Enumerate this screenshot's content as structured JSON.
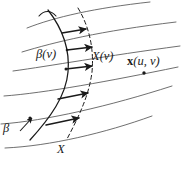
{
  "figure": {
    "kind": "geometry-diagram",
    "width": 184,
    "height": 169,
    "background_color": "#ffffff",
    "ink_color": "#1a1a1a",
    "grid_color": "#555555"
  },
  "labels": {
    "beta_of_v": "β(v)",
    "X_of_v": "X(v)",
    "x_of_u_v_vector": "x",
    "x_of_u_v_args": "(u, v)",
    "beta": "β",
    "X": "X"
  },
  "curves": {
    "surface_parameter_lines": [
      {
        "name": "u-curve-1",
        "path": "M 27 28 C 55 17, 95 8, 150 2"
      },
      {
        "name": "u-curve-2",
        "path": "M 22 52 C 55 42, 100 31, 176 22"
      },
      {
        "name": "u-curve-3",
        "path": "M 13 71 C 50 66, 105 56, 180 46"
      },
      {
        "name": "u-curve-4",
        "path": "M 4 96 C 45 93, 110 81, 178 67"
      },
      {
        "name": "u-curve-5",
        "path": "M 1 124 C 45 121, 110 106, 172 86"
      },
      {
        "name": "u-curve-6",
        "path": "M 5 148 C 50 146, 105 133, 152 116"
      }
    ],
    "beta_curve": {
      "name": "beta-curve-solid",
      "path": "M 48 10 C 62 28, 70 50, 68 72 C 66 96, 50 118, 30 140",
      "style": "solid"
    },
    "X_curve": {
      "name": "X-curve-dashed",
      "path": "M 78 8 C 90 28, 94 50, 92 72 C 89 96, 78 118, 67 139",
      "style": "dashed",
      "dash_pattern": "4 3"
    }
  },
  "vectors": [
    {
      "name": "vector-1",
      "from": [
        62,
        33
      ],
      "to": [
        86,
        29
      ]
    },
    {
      "name": "vector-2",
      "from": [
        67,
        50
      ],
      "to": [
        92,
        47
      ]
    },
    {
      "name": "vector-3",
      "from": [
        66,
        69
      ],
      "to": [
        92,
        66
      ]
    },
    {
      "name": "vector-4",
      "from": [
        58,
        99
      ],
      "to": [
        88,
        93
      ]
    },
    {
      "name": "vector-5",
      "from": [
        46,
        125
      ],
      "to": [
        79,
        118
      ]
    }
  ],
  "points": [
    {
      "name": "surface-point-x-uv",
      "at": [
        144,
        73
      ],
      "marker": "dot"
    },
    {
      "name": "beta-tip-point",
      "at": [
        30,
        119
      ],
      "marker": "dot"
    }
  ],
  "beta_tangent_arrow": {
    "name": "beta-direction-arrow",
    "from": [
      22,
      130
    ],
    "to": [
      33,
      117
    ]
  },
  "beta_top_hook": {
    "name": "beta-top-hook",
    "path": "M 39 16 C 44 10, 51 10, 56 16"
  }
}
